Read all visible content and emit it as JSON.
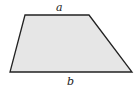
{
  "diagram": {
    "shape": "trapezoid",
    "fill_color": "#e6e6e6",
    "stroke_color": "#222222",
    "vertices": {
      "top_left": [
        25,
        15
      ],
      "top_right": [
        89,
        15
      ],
      "bottom_right": [
        132,
        72
      ],
      "bottom_left": [
        10,
        72
      ]
    },
    "labels": {
      "top": "a",
      "bottom": "b"
    }
  }
}
